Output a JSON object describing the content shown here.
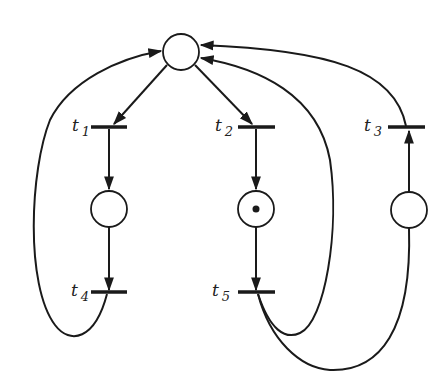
{
  "diagram": {
    "type": "petri-net",
    "colors": {
      "stroke": "#1a1a1a",
      "background": "#ffffff"
    },
    "places": [
      {
        "id": "p0",
        "x": 181,
        "y": 52,
        "tokens": 0
      },
      {
        "id": "p1",
        "x": 109,
        "y": 209,
        "tokens": 0
      },
      {
        "id": "p2",
        "x": 256,
        "y": 209,
        "tokens": 1
      },
      {
        "id": "p3",
        "x": 409,
        "y": 210,
        "tokens": 0
      }
    ],
    "transitions": [
      {
        "id": "t1",
        "label": "t",
        "sub": "1",
        "x": 109,
        "y": 127
      },
      {
        "id": "t2",
        "label": "t",
        "sub": "2",
        "x": 256,
        "y": 127
      },
      {
        "id": "t3",
        "label": "t",
        "sub": "3",
        "x": 406,
        "y": 127
      },
      {
        "id": "t4",
        "label": "t",
        "sub": "4",
        "x": 109,
        "y": 292
      },
      {
        "id": "t5",
        "label": "t",
        "sub": "5",
        "x": 256,
        "y": 292
      }
    ],
    "arcs": [
      [
        "p0",
        "t1"
      ],
      [
        "p0",
        "t2"
      ],
      [
        "t1",
        "p1"
      ],
      [
        "t2",
        "p2"
      ],
      [
        "p1",
        "t4"
      ],
      [
        "p2",
        "t5"
      ],
      [
        "t4",
        "p0"
      ],
      [
        "t5",
        "p0"
      ],
      [
        "t5",
        "p3"
      ],
      [
        "p3",
        "t3"
      ],
      [
        "t3",
        "p0"
      ]
    ]
  }
}
